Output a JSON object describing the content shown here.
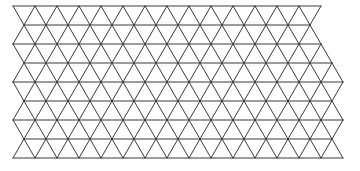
{
  "diagram": {
    "type": "triangular-lattice",
    "stroke_color": "#3a3a3a",
    "background": "#ffffff",
    "stroke_width": 1,
    "x0": 13,
    "step_x": 22,
    "row_y": [
      6,
      25,
      44,
      63,
      82,
      101,
      120,
      139,
      158
    ],
    "row_start_x": [
      13,
      24,
      13,
      24,
      13,
      24,
      13,
      24,
      13
    ],
    "row_end_x": [
      321,
      310,
      321,
      332,
      343,
      332,
      343,
      332,
      343
    ]
  }
}
